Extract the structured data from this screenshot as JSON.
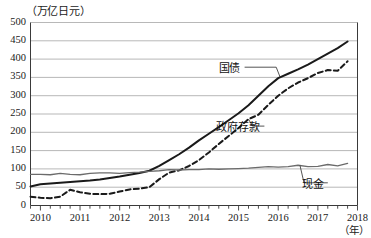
{
  "chart_data": {
    "type": "line",
    "title": "",
    "subtitle": "",
    "xlabel": "（年）",
    "ylabel": "（万亿日元）",
    "ylim": [
      0,
      500
    ],
    "xlim": [
      2009.75,
      2018.0
    ],
    "ytick_labels": [
      "0",
      "50",
      "100",
      "150",
      "200",
      "250",
      "300",
      "350",
      "400",
      "450",
      "500"
    ],
    "ytick_values": [
      0,
      50,
      100,
      150,
      200,
      250,
      300,
      350,
      400,
      450,
      500
    ],
    "xtick_labels": [
      "2010",
      "2011",
      "2012",
      "2013",
      "2014",
      "2015",
      "2016",
      "2017",
      "2018"
    ],
    "xtick_values": [
      2010,
      2011,
      2012,
      2013,
      2014,
      2015,
      2016,
      2017,
      2018
    ],
    "minor_xticks_per_year": 4,
    "grid": "horizontal",
    "legend_position": "inline-annotations",
    "annotations": [
      {
        "name": "kokusai",
        "label": "国债",
        "series": "国债",
        "x": 2015.1,
        "y": 378
      },
      {
        "name": "seifu-yokin",
        "label": "政府存款",
        "series": "政府存款",
        "x": 2015.6,
        "y": 217
      },
      {
        "name": "genkin",
        "label": "现金",
        "series": "现金",
        "x": 2017.2,
        "y": 62
      }
    ],
    "series": [
      {
        "name": "国债",
        "style": "solid",
        "color": "#1a1a1a",
        "width": 2.0,
        "x": [
          2009.75,
          2010.0,
          2010.25,
          2010.5,
          2010.75,
          2011.0,
          2011.25,
          2011.5,
          2011.75,
          2012.0,
          2012.25,
          2012.5,
          2012.75,
          2013.0,
          2013.25,
          2013.5,
          2013.75,
          2014.0,
          2014.25,
          2014.5,
          2014.75,
          2015.0,
          2015.25,
          2015.5,
          2015.75,
          2016.0,
          2016.25,
          2016.5,
          2016.75,
          2017.0,
          2017.25,
          2017.5,
          2017.75
        ],
        "values": [
          52,
          58,
          60,
          62,
          64,
          66,
          68,
          71,
          75,
          79,
          84,
          89,
          95,
          108,
          124,
          140,
          158,
          178,
          196,
          214,
          233,
          252,
          274,
          300,
          326,
          348,
          360,
          372,
          385,
          400,
          415,
          430,
          448
        ]
      },
      {
        "name": "政府存款",
        "style": "dashed",
        "color": "#1a1a1a",
        "width": 2.0,
        "x": [
          2009.75,
          2010.0,
          2010.25,
          2010.5,
          2010.75,
          2011.0,
          2011.25,
          2011.5,
          2011.75,
          2012.0,
          2012.25,
          2012.5,
          2012.75,
          2013.0,
          2013.25,
          2013.5,
          2013.75,
          2014.0,
          2014.25,
          2014.5,
          2014.75,
          2015.0,
          2015.25,
          2015.5,
          2015.75,
          2016.0,
          2016.25,
          2016.5,
          2016.75,
          2017.0,
          2017.25,
          2017.5,
          2017.75
        ],
        "values": [
          24,
          21,
          20,
          24,
          43,
          36,
          32,
          31,
          32,
          38,
          44,
          46,
          50,
          72,
          90,
          96,
          108,
          124,
          145,
          168,
          190,
          212,
          236,
          248,
          275,
          300,
          320,
          336,
          348,
          362,
          370,
          368,
          394
        ]
      },
      {
        "name": "现金",
        "style": "solid",
        "color": "#6b6b6b",
        "width": 1.3,
        "x": [
          2009.75,
          2010.0,
          2010.25,
          2010.5,
          2010.75,
          2011.0,
          2011.25,
          2011.5,
          2011.75,
          2012.0,
          2012.25,
          2012.5,
          2012.75,
          2013.0,
          2013.25,
          2013.5,
          2013.75,
          2014.0,
          2014.25,
          2014.5,
          2014.75,
          2015.0,
          2015.25,
          2015.5,
          2015.75,
          2016.0,
          2016.25,
          2016.5,
          2016.75,
          2017.0,
          2017.25,
          2017.5,
          2017.75
        ],
        "values": [
          85,
          85,
          84,
          88,
          85,
          84,
          88,
          89,
          89,
          88,
          90,
          91,
          93,
          95,
          98,
          97,
          98,
          98,
          100,
          99,
          100,
          101,
          102,
          104,
          106,
          105,
          106,
          110,
          106,
          107,
          112,
          108,
          115
        ]
      }
    ]
  }
}
